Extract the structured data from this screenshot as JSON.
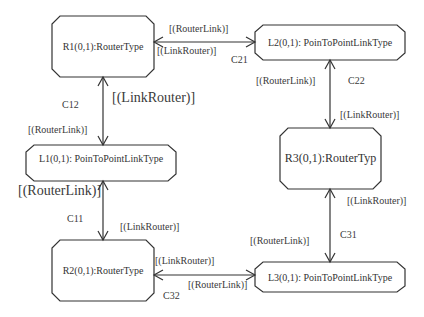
{
  "nodes": {
    "r1": {
      "label": "R1(0,1):RouterType"
    },
    "l2": {
      "label": "L2(0,1): PoinToPointLinkType"
    },
    "l1": {
      "label": "L1(0,1): PoinToPointLinkType"
    },
    "r3": {
      "label": "R3(0,1):RouterTyp"
    },
    "r2": {
      "label": "R2(0,1):RouterType"
    },
    "l3": {
      "label": "L3(0,1): PoinToPointLinkType"
    }
  },
  "connectors": {
    "c21": {
      "name": "C21",
      "end_a": "[(RouterLink)]",
      "end_b": "[(LinkRouter)]"
    },
    "c12": {
      "name": "C12",
      "end_a": "[(LinkRouter)]",
      "end_b": "[(RouterLink)]"
    },
    "c22": {
      "name": "C22",
      "end_a": "[(RouterLink)]",
      "end_b": "[(LinkRouter)]"
    },
    "c11": {
      "name": "C11",
      "end_a": "[(RouterLink)]",
      "end_b": "[(LinkRouter)]"
    },
    "c31": {
      "name": "C31",
      "end_a": "[(LinkRouter)]",
      "end_b": "[(RouterLink)]"
    },
    "c32": {
      "name": "C32",
      "end_a": "[(LinkRouter)]",
      "end_b": "[(RouterLink)]"
    }
  },
  "colors": {
    "stroke": "#333333",
    "background": "#ffffff"
  }
}
